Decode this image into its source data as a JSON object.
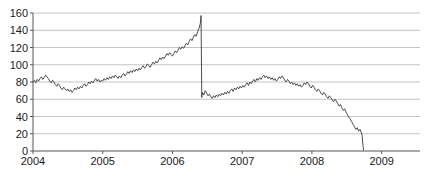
{
  "chart_data": {
    "type": "line",
    "title": "",
    "subtitle": "",
    "xlabel": "",
    "ylabel": "",
    "xlim": [
      2004.0,
      2009.55
    ],
    "ylim": [
      0,
      160
    ],
    "grid": true,
    "grid_axis": "y",
    "legend": null,
    "legend_position": "none",
    "axis_color": "#555555",
    "grid_color": "#b4b4b4",
    "line_color": "#3a3a3a",
    "background_color": "#ffffff",
    "yticks": [
      0,
      20,
      40,
      60,
      80,
      100,
      120,
      140,
      160
    ],
    "ytick_labels": [
      "0",
      "20",
      "40",
      "60",
      "80",
      "100",
      "120",
      "140",
      "160"
    ],
    "xticks": [
      2004,
      2005,
      2006,
      2007,
      2008,
      2009
    ],
    "xtick_labels": [
      "2004",
      "2005",
      "2006",
      "2007",
      "2008",
      "2009"
    ],
    "annotations": [
      {
        "label": "sharp-gap-down-2006",
        "x": 2006.42,
        "y_from": 157,
        "y_to": 62
      },
      {
        "label": "collapse-to-zero-2008",
        "x": 2008.72,
        "y_from": 18,
        "y_to": 1
      }
    ],
    "series": [
      {
        "name": "price",
        "color": "#3a3a3a",
        "x": [
          2004.0,
          2004.02,
          2004.04,
          2004.06,
          2004.08,
          2004.1,
          2004.12,
          2004.14,
          2004.16,
          2004.18,
          2004.2,
          2004.22,
          2004.24,
          2004.26,
          2004.28,
          2004.3,
          2004.32,
          2004.34,
          2004.36,
          2004.38,
          2004.4,
          2004.42,
          2004.44,
          2004.46,
          2004.48,
          2004.5,
          2004.52,
          2004.54,
          2004.56,
          2004.58,
          2004.6,
          2004.62,
          2004.64,
          2004.66,
          2004.68,
          2004.7,
          2004.72,
          2004.74,
          2004.76,
          2004.78,
          2004.8,
          2004.82,
          2004.84,
          2004.86,
          2004.88,
          2004.9,
          2004.92,
          2004.94,
          2004.96,
          2004.98,
          2005.0,
          2005.02,
          2005.04,
          2005.06,
          2005.08,
          2005.1,
          2005.12,
          2005.14,
          2005.16,
          2005.18,
          2005.2,
          2005.22,
          2005.24,
          2005.26,
          2005.28,
          2005.3,
          2005.32,
          2005.34,
          2005.36,
          2005.38,
          2005.4,
          2005.42,
          2005.44,
          2005.46,
          2005.48,
          2005.5,
          2005.52,
          2005.54,
          2005.56,
          2005.58,
          2005.6,
          2005.62,
          2005.64,
          2005.66,
          2005.68,
          2005.7,
          2005.72,
          2005.74,
          2005.76,
          2005.78,
          2005.8,
          2005.82,
          2005.84,
          2005.86,
          2005.88,
          2005.9,
          2005.92,
          2005.94,
          2005.96,
          2005.98,
          2006.0,
          2006.02,
          2006.04,
          2006.06,
          2006.08,
          2006.1,
          2006.12,
          2006.14,
          2006.16,
          2006.18,
          2006.2,
          2006.22,
          2006.24,
          2006.26,
          2006.28,
          2006.3,
          2006.32,
          2006.34,
          2006.36,
          2006.38,
          2006.4,
          2006.41,
          2006.42,
          2006.43,
          2006.45,
          2006.47,
          2006.49,
          2006.51,
          2006.53,
          2006.55,
          2006.57,
          2006.59,
          2006.61,
          2006.63,
          2006.65,
          2006.67,
          2006.69,
          2006.71,
          2006.73,
          2006.75,
          2006.77,
          2006.79,
          2006.81,
          2006.83,
          2006.85,
          2006.87,
          2006.89,
          2006.91,
          2006.93,
          2006.95,
          2006.97,
          2006.99,
          2007.01,
          2007.03,
          2007.05,
          2007.07,
          2007.09,
          2007.11,
          2007.13,
          2007.15,
          2007.17,
          2007.19,
          2007.21,
          2007.23,
          2007.25,
          2007.27,
          2007.29,
          2007.31,
          2007.33,
          2007.35,
          2007.37,
          2007.39,
          2007.41,
          2007.43,
          2007.45,
          2007.47,
          2007.49,
          2007.51,
          2007.53,
          2007.55,
          2007.57,
          2007.59,
          2007.61,
          2007.63,
          2007.65,
          2007.67,
          2007.69,
          2007.71,
          2007.73,
          2007.75,
          2007.77,
          2007.79,
          2007.81,
          2007.83,
          2007.85,
          2007.87,
          2007.89,
          2007.91,
          2007.93,
          2007.95,
          2007.97,
          2007.99,
          2008.01,
          2008.03,
          2008.05,
          2008.07,
          2008.09,
          2008.11,
          2008.13,
          2008.15,
          2008.17,
          2008.19,
          2008.21,
          2008.23,
          2008.25,
          2008.27,
          2008.29,
          2008.31,
          2008.33,
          2008.35,
          2008.37,
          2008.39,
          2008.41,
          2008.43,
          2008.45,
          2008.47,
          2008.49,
          2008.51,
          2008.53,
          2008.55,
          2008.57,
          2008.59,
          2008.61,
          2008.63,
          2008.65,
          2008.67,
          2008.69,
          2008.71,
          2008.72,
          2008.73,
          2008.74
        ],
        "y": [
          80,
          82,
          79,
          83,
          81,
          84,
          86,
          83,
          85,
          88,
          86,
          84,
          81,
          79,
          82,
          80,
          77,
          75,
          78,
          76,
          73,
          71,
          74,
          72,
          70,
          72,
          69,
          71,
          68,
          70,
          73,
          71,
          74,
          72,
          75,
          73,
          76,
          78,
          75,
          77,
          80,
          78,
          81,
          79,
          82,
          84,
          81,
          83,
          80,
          82,
          81,
          84,
          82,
          85,
          83,
          86,
          84,
          87,
          85,
          88,
          86,
          84,
          87,
          85,
          88,
          90,
          87,
          89,
          92,
          90,
          93,
          91,
          94,
          92,
          95,
          93,
          96,
          94,
          97,
          99,
          96,
          98,
          101,
          99,
          97,
          100,
          103,
          101,
          104,
          102,
          105,
          108,
          106,
          109,
          107,
          110,
          113,
          111,
          114,
          112,
          110,
          113,
          116,
          114,
          117,
          120,
          118,
          121,
          119,
          122,
          125,
          123,
          127,
          130,
          128,
          132,
          135,
          133,
          138,
          142,
          148,
          157,
          62,
          68,
          65,
          70,
          67,
          64,
          66,
          63,
          61,
          64,
          62,
          65,
          63,
          66,
          64,
          67,
          65,
          68,
          66,
          69,
          67,
          70,
          72,
          69,
          73,
          71,
          74,
          72,
          75,
          73,
          76,
          74,
          77,
          79,
          76,
          80,
          78,
          81,
          83,
          80,
          84,
          82,
          85,
          83,
          86,
          88,
          85,
          87,
          84,
          86,
          83,
          85,
          82,
          84,
          81,
          83,
          86,
          84,
          87,
          85,
          82,
          80,
          83,
          81,
          78,
          80,
          77,
          79,
          76,
          78,
          75,
          77,
          74,
          76,
          79,
          77,
          80,
          78,
          75,
          73,
          76,
          74,
          71,
          69,
          72,
          70,
          67,
          65,
          68,
          66,
          63,
          61,
          64,
          62,
          59,
          57,
          60,
          58,
          55,
          52,
          54,
          50,
          47,
          49,
          45,
          42,
          39,
          37,
          34,
          31,
          28,
          25,
          27,
          23,
          25,
          21,
          18,
          8,
          1
        ]
      }
    ]
  }
}
